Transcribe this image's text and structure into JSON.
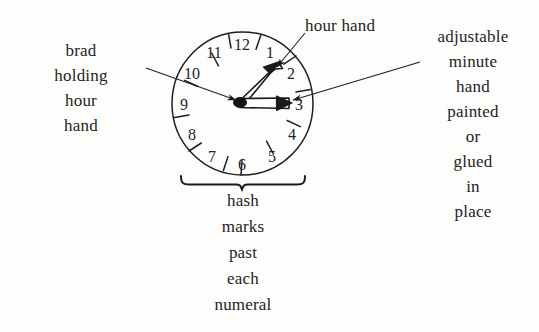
{
  "figure": {
    "background_color": "#fdfdfc",
    "ink_color": "#242424"
  },
  "clock": {
    "center": {
      "x": 242,
      "y": 103
    },
    "radius": 71,
    "numerals": [
      {
        "value": "12",
        "angle_deg": 0,
        "x": 242,
        "y": 44
      },
      {
        "value": "1",
        "angle_deg": 30,
        "x": 271,
        "y": 52
      },
      {
        "value": "2",
        "angle_deg": 60,
        "x": 293,
        "y": 74
      },
      {
        "value": "3",
        "angle_deg": 90,
        "x": 301,
        "y": 104
      },
      {
        "value": "4",
        "angle_deg": 120,
        "x": 293,
        "y": 134
      },
      {
        "value": "5",
        "angle_deg": 150,
        "x": 272,
        "y": 156
      },
      {
        "value": "6",
        "angle_deg": 180,
        "x": 242,
        "y": 164
      },
      {
        "value": "7",
        "angle_deg": 210,
        "x": 212,
        "y": 156
      },
      {
        "value": "8",
        "angle_deg": 240,
        "x": 190,
        "y": 134
      },
      {
        "value": "9",
        "angle_deg": 270,
        "x": 182,
        "y": 104
      },
      {
        "value": "10",
        "angle_deg": 300,
        "x": 190,
        "y": 73
      },
      {
        "value": "11",
        "angle_deg": 330,
        "x": 213,
        "y": 52
      }
    ],
    "hash_marks_count": 12,
    "hash_mark_note": "one hash mark just past each numeral, between numerals",
    "hour_hand": {
      "style": "hollow outline arrow",
      "points_to": "between 1 and 2",
      "angle_deg": 47
    },
    "minute_hand": {
      "style": "hollow outline arrow",
      "points_to": "3",
      "angle_deg": 92
    }
  },
  "labels": {
    "brad": {
      "name": "brad holding hour hand",
      "lines": [
        "brad",
        "holding",
        "hour",
        "hand"
      ]
    },
    "hour_hand": {
      "name": "hour hand",
      "text": "hour hand"
    },
    "adjustable": {
      "name": "adjustable minute hand",
      "lines": [
        "adjustable",
        "minute",
        "hand",
        "painted",
        "or",
        "glued",
        "in",
        "place"
      ]
    },
    "hash": {
      "name": "hash marks past each numeral",
      "lines": [
        "hash",
        "marks",
        "past",
        "each",
        "numeral"
      ]
    }
  },
  "leader_lines": [
    {
      "name": "brad-leader",
      "from": {
        "x": 146,
        "y": 68
      },
      "to": {
        "x": 238,
        "y": 100
      },
      "arrow": true
    },
    {
      "name": "hour-hand-leader",
      "from": {
        "x": 303,
        "y": 32
      },
      "to": {
        "x": 276,
        "y": 66
      },
      "arrow": true
    },
    {
      "name": "adjustable-leader",
      "from": {
        "x": 419,
        "y": 62
      },
      "to": {
        "x": 290,
        "y": 99
      },
      "arrow": true
    }
  ],
  "brace": {
    "name": "hash-marks-brace",
    "left_x": 180,
    "right_x": 305,
    "y": 184,
    "tip_x": 242
  }
}
